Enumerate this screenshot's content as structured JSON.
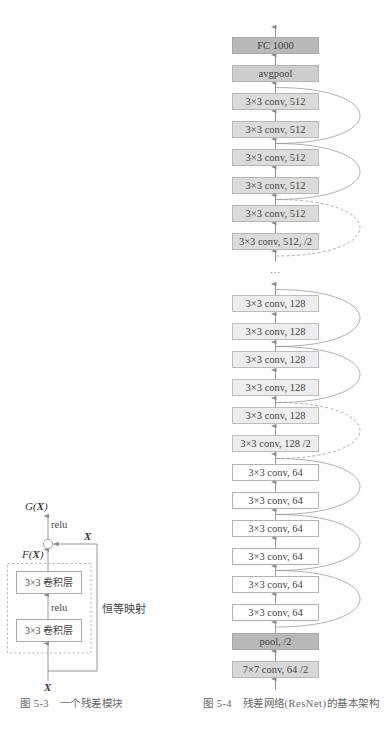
{
  "figure_5_3": {
    "output_label": [
      "G",
      "(",
      "X",
      ")"
    ],
    "relu_top": "relu",
    "skip_label": "X",
    "residual_label": [
      "F",
      "(",
      "X",
      ")"
    ],
    "conv_layers": [
      "3×3 卷积层",
      "3×3 卷积层"
    ],
    "relu_mid": "relu",
    "identity_label": "恒等映射",
    "input_label": "X",
    "caption": "图 5-3　一个残差模块"
  },
  "figure_5_4": {
    "layers": [
      {
        "label": "FC 1000",
        "fill": "#b9b9b9"
      },
      {
        "label": "avgpool",
        "fill": "#cdcdcd"
      },
      {
        "label": "3×3 conv, 512",
        "fill": "#dcdcdc"
      },
      {
        "label": "3×3 conv, 512",
        "fill": "#dcdcdc"
      },
      {
        "label": "3×3 conv, 512",
        "fill": "#dcdcdc"
      },
      {
        "label": "3×3 conv, 512",
        "fill": "#dcdcdc"
      },
      {
        "label": "3×3 conv, 512",
        "fill": "#dcdcdc"
      },
      {
        "label": "3×3 conv, 512, /2",
        "fill": "#dcdcdc"
      },
      {
        "label": "3×3 conv, 128",
        "fill": "#ededed"
      },
      {
        "label": "3×3 conv, 128",
        "fill": "#ededed"
      },
      {
        "label": "3×3 conv, 128",
        "fill": "#ededed"
      },
      {
        "label": "3×3 conv, 128",
        "fill": "#ededed"
      },
      {
        "label": "3×3 conv, 128",
        "fill": "#ededed"
      },
      {
        "label": "3×3 conv, 128 /2",
        "fill": "#ededed"
      },
      {
        "label": "3×3 conv, 64",
        "fill": "#ffffff"
      },
      {
        "label": "3×3 conv, 64",
        "fill": "#ffffff"
      },
      {
        "label": "3×3 conv, 64",
        "fill": "#ffffff"
      },
      {
        "label": "3×3 conv, 64",
        "fill": "#ffffff"
      },
      {
        "label": "3×3 conv, 64",
        "fill": "#ffffff"
      },
      {
        "label": "3×3 conv, 64",
        "fill": "#ffffff"
      },
      {
        "label": "pool, /2",
        "fill": "#b9b9b9"
      },
      {
        "label": "7×7 conv, 64 /2",
        "fill": "#d8d8d8"
      }
    ],
    "ellipsis": "...",
    "skip_connections": [
      {
        "from": "3×3 conv, 512 (block 3 input)",
        "style": "solid"
      },
      {
        "from": "3×3 conv, 512 (block 2 input)",
        "style": "solid"
      },
      {
        "from": "3×3 conv, 512 /2 (block 1 input)",
        "style": "dashed"
      },
      {
        "from": "3×3 conv, 128 (block 3 input)",
        "style": "solid"
      },
      {
        "from": "3×3 conv, 128 (block 2 input)",
        "style": "solid"
      },
      {
        "from": "3×3 conv, 128 /2 (block 1 input)",
        "style": "dashed"
      },
      {
        "from": "3×3 conv, 64 (block 3 input)",
        "style": "solid"
      },
      {
        "from": "3×3 conv, 64 (block 2 input)",
        "style": "solid"
      },
      {
        "from": "3×3 conv, 64 (block 1 input)",
        "style": "solid"
      }
    ],
    "caption": "图 5-4　残差网络(ResNet)的基本架构"
  },
  "colors": {
    "line": "#8c8c8c",
    "skip_line": "#9a9a9a",
    "text": "#444444",
    "caption": "#666666"
  }
}
